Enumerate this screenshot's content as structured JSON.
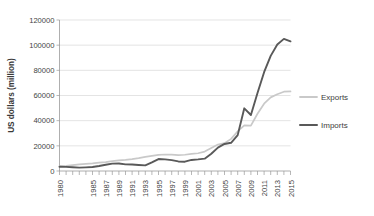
{
  "chart_data": {
    "type": "line",
    "title": "",
    "xlabel": "",
    "ylabel": "US dollars (million)",
    "ylim": [
      0,
      120000
    ],
    "ytick_values": [
      0,
      20000,
      40000,
      60000,
      80000,
      100000,
      120000
    ],
    "ytick_labels": [
      "0",
      "20000",
      "40000",
      "60000",
      "80000",
      "100000",
      "120000"
    ],
    "xlim": [
      1980,
      2015
    ],
    "x": [
      1980,
      1981,
      1982,
      1983,
      1984,
      1985,
      1986,
      1987,
      1988,
      1989,
      1990,
      1991,
      1992,
      1993,
      1994,
      1995,
      1996,
      1997,
      1998,
      1999,
      2000,
      2001,
      2002,
      2003,
      2004,
      2005,
      2006,
      2007,
      2008,
      2009,
      2010,
      2011,
      2012,
      2013,
      2014,
      2015
    ],
    "xtick_labels": [
      "1980",
      "1985",
      "1987",
      "1989",
      "1991",
      "1993",
      "1995",
      "1997",
      "1999",
      "2001",
      "2003",
      "2005",
      "2007",
      "2009",
      "2011",
      "2013",
      "2015"
    ],
    "xtick_label_values": [
      1980,
      1985,
      1987,
      1989,
      1991,
      1993,
      1995,
      1997,
      1999,
      2001,
      2003,
      2005,
      2007,
      2009,
      2011,
      2013,
      2015
    ],
    "grid": true,
    "legend_position": "right",
    "series": [
      {
        "name": "Exports",
        "color": "#c9c9c9",
        "values": [
          3800,
          4100,
          4600,
          5200,
          5600,
          6000,
          6600,
          7100,
          7800,
          8400,
          8800,
          9400,
          10200,
          11200,
          12000,
          12800,
          13100,
          13000,
          12600,
          12900,
          13600,
          14100,
          15400,
          18200,
          21000,
          22100,
          25500,
          31500,
          36200,
          36000,
          45500,
          53500,
          58500,
          61000,
          63000,
          63200
        ]
      },
      {
        "name": "Imports",
        "color": "#595959",
        "values": [
          3400,
          3300,
          3000,
          2700,
          2900,
          3200,
          4000,
          5000,
          5900,
          6000,
          5300,
          5200,
          4800,
          4500,
          6800,
          9500,
          9200,
          8600,
          7600,
          7400,
          8800,
          9200,
          9800,
          13700,
          18600,
          21500,
          22400,
          28500,
          49800,
          44500,
          62000,
          78500,
          91500,
          100500,
          105000,
          103000
        ]
      }
    ],
    "legend": [
      {
        "label": "Exports",
        "color": "#c9c9c9"
      },
      {
        "label": "Imports",
        "color": "#595959"
      }
    ]
  },
  "colors": {
    "exports": "#c9c9c9",
    "imports": "#595959",
    "grid": "#d9d9d9",
    "axis": "#9a9a9a",
    "text": "#404040",
    "background": "#ffffff"
  }
}
